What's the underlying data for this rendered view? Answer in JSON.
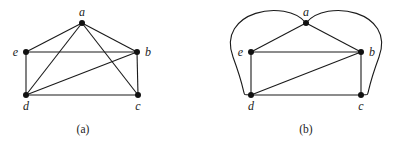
{
  "figures": [
    {
      "id": "a",
      "caption": "(a)",
      "nodes": [
        {
          "id": "a",
          "label": "a"
        },
        {
          "id": "b",
          "label": "b"
        },
        {
          "id": "c",
          "label": "c"
        },
        {
          "id": "d",
          "label": "d"
        },
        {
          "id": "e",
          "label": "e"
        }
      ],
      "edges": [
        [
          "a",
          "e"
        ],
        [
          "a",
          "b"
        ],
        [
          "a",
          "d"
        ],
        [
          "a",
          "c"
        ],
        [
          "e",
          "b"
        ],
        [
          "e",
          "d"
        ],
        [
          "b",
          "d"
        ],
        [
          "b",
          "c"
        ],
        [
          "d",
          "c"
        ]
      ]
    },
    {
      "id": "b",
      "caption": "(b)",
      "nodes": [
        {
          "id": "a",
          "label": "a"
        },
        {
          "id": "b",
          "label": "b"
        },
        {
          "id": "c",
          "label": "c"
        },
        {
          "id": "d",
          "label": "d"
        },
        {
          "id": "e",
          "label": "e"
        }
      ],
      "edges": [
        [
          "a",
          "e"
        ],
        [
          "a",
          "b"
        ],
        [
          "e",
          "b"
        ],
        [
          "e",
          "d"
        ],
        [
          "b",
          "d"
        ],
        [
          "b",
          "c"
        ],
        [
          "d",
          "c"
        ]
      ],
      "curved_edges": [
        [
          "a",
          "d"
        ],
        [
          "a",
          "c"
        ]
      ]
    }
  ]
}
